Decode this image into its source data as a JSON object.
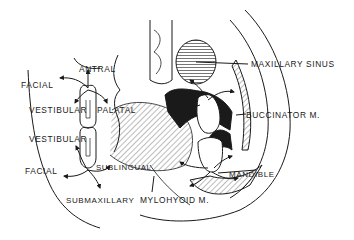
{
  "diagram": {
    "type": "anatomical cross-section (coronal) showing spread of dental infection pathways",
    "labels": {
      "antral": "ANTRAL",
      "facial_upper": "FACIAL",
      "vestibular_upper": "VESTIBULAR",
      "palatal": "PALATAL",
      "vestibular_lower": "VESTIBULAR",
      "facial_lower": "FACIAL",
      "sublingual": "SUBLINGUAL",
      "submaxillary": "SUBMAXILLARY",
      "mylohyoid": "MYLOHYOID M.",
      "mandible": "MANDIBLE",
      "maxillary_sinus": "MAXILLARY SINUS",
      "buccinator": "BUCCINATOR M."
    },
    "colors": {
      "ink": "#1a1a1a",
      "background": "#ffffff"
    }
  }
}
